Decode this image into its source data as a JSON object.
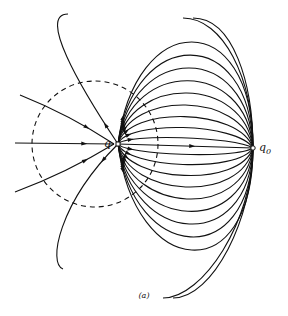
{
  "figure": {
    "caption": "(a)",
    "charges": [
      {
        "id": "q",
        "label": "q",
        "x": 118,
        "y": 144
      },
      {
        "id": "q0",
        "label": "q",
        "subscript": "0",
        "x": 253,
        "y": 148
      }
    ],
    "dashed_circle": {
      "cx": 95,
      "cy": 144,
      "r": 63
    },
    "line_color": "#111111"
  }
}
